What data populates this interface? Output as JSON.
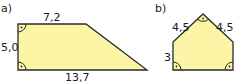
{
  "figure_a": {
    "label": "a)",
    "shape": "right trapezoid",
    "top_side": "7,2",
    "left_side": "5,0",
    "bottom_side": "13,7",
    "right_angles": 2
  },
  "figure_b": {
    "label": "b)",
    "shape": "pentagon",
    "upper_left_side": "4,5",
    "upper_right_side": "4,5",
    "left_side": "3",
    "right_angles": 3
  },
  "colors": {
    "fill": "#fdf5a6",
    "stroke": "#2a2a2a"
  }
}
